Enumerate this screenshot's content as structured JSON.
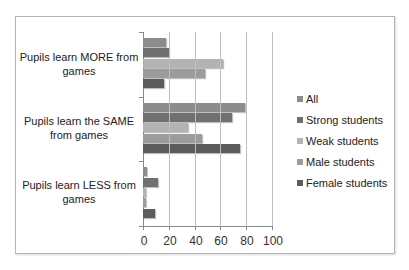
{
  "chart_data": {
    "type": "bar",
    "orientation": "horizontal",
    "title": "",
    "xlabel": "",
    "ylabel": "",
    "xlim": [
      0,
      100
    ],
    "x_ticks": [
      "0",
      "20",
      "40",
      "60",
      "80",
      "100"
    ],
    "grid": true,
    "legend_position": "right",
    "categories": [
      "Pupils learn MORE from games",
      "Pupils learn the SAME from games",
      "Pupils learn LESS from games"
    ],
    "series": [
      {
        "name": "All",
        "color": "#8c8c8c",
        "values": [
          18,
          79,
          3
        ]
      },
      {
        "name": "Strong students",
        "color": "#707070",
        "values": [
          20,
          69,
          12
        ]
      },
      {
        "name": "Weak students",
        "color": "#b3b3b3",
        "values": [
          62,
          35,
          2
        ]
      },
      {
        "name": "Male students",
        "color": "#9c9c9c",
        "values": [
          48,
          46,
          2
        ]
      },
      {
        "name": "Female students",
        "color": "#5c5c5c",
        "values": [
          16,
          75,
          9
        ]
      }
    ]
  },
  "labels": {
    "cat0": "Pupils learn MORE from games",
    "cat1": "Pupils learn the SAME from games",
    "cat2": "Pupils learn LESS from games"
  }
}
